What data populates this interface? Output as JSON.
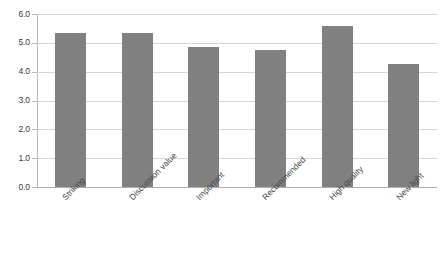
{
  "chart_data": {
    "type": "bar",
    "title": "",
    "xlabel": "",
    "ylabel": "",
    "categories": [
      "Striking",
      "Discussion value",
      "Important",
      "Recommended",
      "High quality",
      "New light"
    ],
    "values": [
      5.35,
      5.35,
      4.85,
      4.75,
      5.6,
      4.25
    ],
    "ylim": [
      0.0,
      6.0
    ],
    "ytick_labels": [
      "0.0",
      "1.0",
      "2.0",
      "3.0",
      "4.0",
      "5.0",
      "6.0"
    ],
    "ytick_values": [
      0.0,
      1.0,
      2.0,
      3.0,
      4.0,
      5.0,
      6.0
    ],
    "grid": "horizontal",
    "legend": "none",
    "bar_color": "#808080",
    "gridline_color": "#d6d6d6",
    "axis_color": "#b9b9b9",
    "background": "#ffffff",
    "label_rotation_degrees": -45
  }
}
